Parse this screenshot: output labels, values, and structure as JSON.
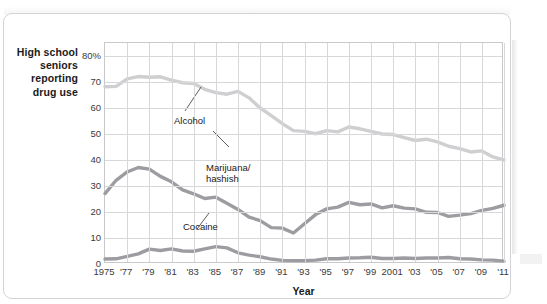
{
  "figure": {
    "y_caption_lines": [
      "High school",
      "seniors",
      "reporting",
      "drug use"
    ],
    "x_axis_title": "Year"
  },
  "chart_data": {
    "type": "line",
    "title": "",
    "xlabel": "Year",
    "ylabel": "High school seniors reporting drug use",
    "xlim": [
      1975,
      2011
    ],
    "ylim": [
      0,
      85
    ],
    "grid": true,
    "legend_position": "inline-annotations",
    "ytick_labels": [
      "0",
      "10",
      "20",
      "30",
      "40",
      "50",
      "60",
      "70",
      "80%"
    ],
    "ytick_values": [
      0,
      10,
      20,
      30,
      40,
      50,
      60,
      70,
      80
    ],
    "xtick_labels": [
      "1975",
      "'77",
      "'79",
      "'81",
      "'83",
      "'85",
      "'87",
      "'89",
      "'91",
      "'93",
      "'95",
      "'97",
      "'99",
      "2001",
      "'03",
      "'05",
      "'07",
      "'09",
      "'11"
    ],
    "xtick_values": [
      1975,
      1977,
      1979,
      1981,
      1983,
      1985,
      1987,
      1989,
      1991,
      1993,
      1995,
      1997,
      1999,
      2001,
      2003,
      2005,
      2007,
      2009,
      2011
    ],
    "x": [
      1975,
      1976,
      1977,
      1978,
      1979,
      1980,
      1981,
      1982,
      1983,
      1984,
      1985,
      1986,
      1987,
      1988,
      1989,
      1990,
      1991,
      1992,
      1993,
      1994,
      1995,
      1996,
      1997,
      1998,
      1999,
      2000,
      2001,
      2002,
      2003,
      2004,
      2005,
      2006,
      2007,
      2008,
      2009,
      2010,
      2011
    ],
    "series": [
      {
        "name": "Alcohol",
        "color": "#cfcfd1",
        "label_text": "Alcohol",
        "values": [
          68.2,
          68.3,
          71.2,
          72.1,
          71.8,
          72.0,
          70.7,
          69.7,
          69.4,
          67.2,
          65.9,
          65.3,
          66.4,
          63.9,
          60.0,
          57.1,
          54.0,
          51.3,
          51.0,
          50.1,
          51.3,
          50.8,
          52.7,
          52.0,
          51.0,
          50.0,
          49.8,
          48.6,
          47.5,
          48.0,
          47.0,
          45.3,
          44.4,
          43.1,
          43.5,
          41.2,
          40.0
        ]
      },
      {
        "name": "Marijuana/hashish",
        "color": "#9d9da1",
        "label_text": "Marijuana/\nhashish",
        "label_line1": "Marijuana/",
        "label_line2": "hashish",
        "values": [
          27.1,
          32.2,
          35.4,
          37.1,
          36.5,
          33.7,
          31.6,
          28.5,
          27.0,
          25.2,
          25.7,
          23.4,
          21.0,
          18.0,
          16.7,
          14.0,
          13.8,
          11.9,
          15.5,
          19.0,
          21.2,
          21.9,
          23.7,
          22.8,
          23.1,
          21.6,
          22.4,
          21.5,
          21.2,
          19.9,
          19.8,
          18.3,
          18.8,
          19.4,
          20.6,
          21.4,
          22.6
        ]
      },
      {
        "name": "Cocaine",
        "color": "#9d9da1",
        "label_text": "Cocaine",
        "values": [
          1.9,
          2.0,
          2.9,
          3.9,
          5.7,
          5.2,
          5.8,
          5.0,
          4.9,
          5.8,
          6.7,
          6.2,
          4.3,
          3.4,
          2.8,
          1.9,
          1.4,
          1.3,
          1.3,
          1.5,
          2.0,
          2.0,
          2.3,
          2.4,
          2.6,
          2.1,
          2.1,
          2.3,
          2.1,
          2.3,
          2.3,
          2.5,
          2.0,
          1.9,
          1.6,
          1.5,
          1.1
        ]
      }
    ],
    "annotations": [
      {
        "name": "alcohol-callout",
        "text": "Alcohol",
        "points_to_year": 1987,
        "points_to_value": 66
      },
      {
        "name": "marijuana-callout",
        "text": "Marijuana/ hashish",
        "points_to_year": 1983,
        "points_to_value": 27
      },
      {
        "name": "cocaine-callout",
        "text": "Cocaine",
        "points_to_year": 1983,
        "points_to_value": 5
      }
    ]
  }
}
